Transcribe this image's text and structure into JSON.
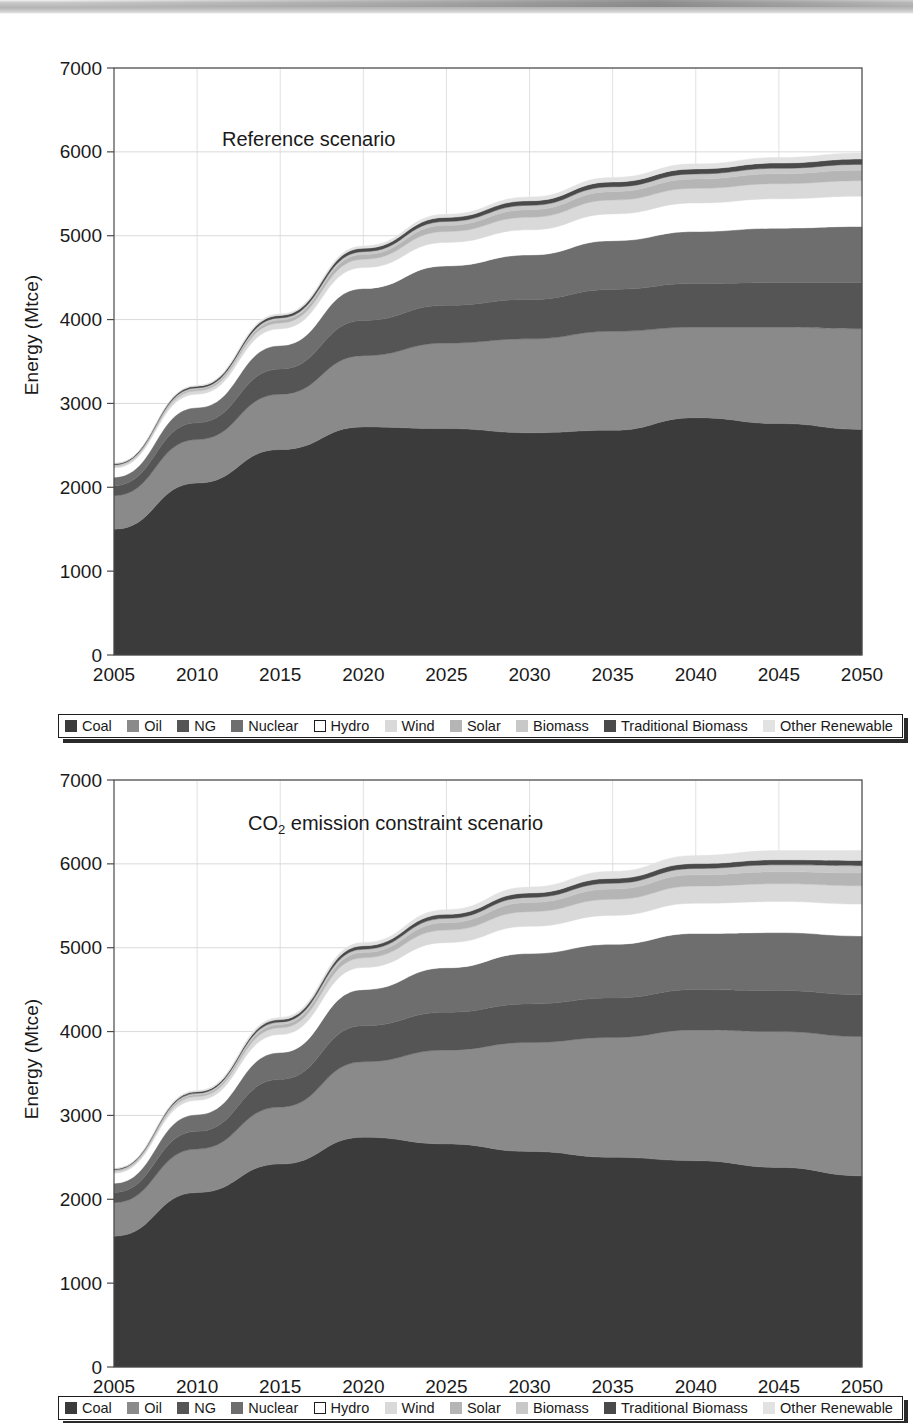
{
  "page": {
    "top_scan_artifact": true,
    "background": "#ffffff"
  },
  "axis": {
    "y_label": "Energy (Mtce)",
    "y_ticks": [
      "0",
      "1000",
      "2000",
      "3000",
      "4000",
      "5000",
      "6000",
      "7000"
    ],
    "x_ticks": [
      "2005",
      "2010",
      "2015",
      "2020",
      "2025",
      "2030",
      "2035",
      "2040",
      "2045",
      "2050"
    ]
  },
  "legend": {
    "items": [
      {
        "label": "Coal",
        "color": "#3b3b3b",
        "style": "solid"
      },
      {
        "label": "Oil",
        "color": "#8a8a8a",
        "style": "solid"
      },
      {
        "label": "NG",
        "color": "#555555",
        "style": "solid"
      },
      {
        "label": "Nuclear",
        "color": "#6e6e6e",
        "style": "solid"
      },
      {
        "label": "Hydro",
        "color": "#ffffff",
        "style": "outline"
      },
      {
        "label": "Wind",
        "color": "#d9d9d9",
        "style": "solid"
      },
      {
        "label": "Solar",
        "color": "#b5b5b5",
        "style": "solid"
      },
      {
        "label": "Biomass",
        "color": "#c8c8c8",
        "style": "solid"
      },
      {
        "label": "Traditional Biomass",
        "color": "#4a4a4a",
        "style": "solid"
      },
      {
        "label": "Other Renewable",
        "color": "#e2e2e2",
        "style": "solid"
      }
    ]
  },
  "chart_data": [
    {
      "id": "reference",
      "type": "area",
      "stacked": true,
      "title": "Reference scenario",
      "xlabel": "",
      "ylabel": "Energy (Mtce)",
      "ylim": [
        0,
        7000
      ],
      "xlim": [
        2005,
        2050
      ],
      "grid": true,
      "legend_position": "bottom",
      "x": [
        2005,
        2010,
        2015,
        2020,
        2025,
        2030,
        2035,
        2040,
        2045,
        2050
      ],
      "series": [
        {
          "name": "Coal",
          "color": "#3b3b3b",
          "values": [
            1500,
            2050,
            2450,
            2720,
            2700,
            2650,
            2680,
            2830,
            2760,
            2690
          ]
        },
        {
          "name": "Oil",
          "color": "#8a8a8a",
          "values": [
            400,
            520,
            660,
            850,
            1020,
            1120,
            1180,
            1080,
            1150,
            1200
          ]
        },
        {
          "name": "NG",
          "color": "#555555",
          "values": [
            120,
            200,
            300,
            420,
            450,
            470,
            500,
            520,
            530,
            550
          ]
        },
        {
          "name": "Nuclear",
          "color": "#6e6e6e",
          "values": [
            100,
            180,
            280,
            380,
            470,
            530,
            580,
            620,
            650,
            670
          ]
        },
        {
          "name": "Hydro",
          "color": "#ffffff",
          "values": [
            110,
            160,
            200,
            250,
            280,
            300,
            320,
            340,
            350,
            360
          ]
        },
        {
          "name": "Wind",
          "color": "#d9d9d9",
          "values": [
            20,
            40,
            70,
            100,
            130,
            150,
            165,
            175,
            180,
            185
          ]
        },
        {
          "name": "Solar",
          "color": "#b5b5b5",
          "values": [
            10,
            20,
            35,
            55,
            75,
            90,
            100,
            110,
            118,
            125
          ]
        },
        {
          "name": "Biomass",
          "color": "#c8c8c8",
          "values": [
            8,
            15,
            25,
            35,
            45,
            52,
            58,
            62,
            66,
            70
          ]
        },
        {
          "name": "Traditional Biomass",
          "color": "#4a4a4a",
          "values": [
            12,
            20,
            30,
            40,
            48,
            54,
            58,
            60,
            62,
            64
          ]
        },
        {
          "name": "Other Renewable",
          "color": "#e2e2e2",
          "values": [
            5,
            10,
            18,
            28,
            38,
            46,
            54,
            60,
            66,
            72
          ]
        }
      ],
      "totals": [
        2285,
        3215,
        4068,
        4878,
        5256,
        5462,
        5695,
        5857,
        5932,
        5986
      ]
    },
    {
      "id": "co2-constraint",
      "type": "area",
      "stacked": true,
      "title": "CO2 emission constraint scenario",
      "title_html": "CO<sub>2</sub> emission constraint scenario",
      "xlabel": "",
      "ylabel": "Energy (Mtce)",
      "ylim": [
        0,
        7000
      ],
      "xlim": [
        2005,
        2050
      ],
      "grid": true,
      "legend_position": "bottom",
      "x": [
        2005,
        2010,
        2015,
        2020,
        2025,
        2030,
        2035,
        2040,
        2045,
        2050
      ],
      "series": [
        {
          "name": "Coal",
          "color": "#3b3b3b",
          "values": [
            1560,
            2080,
            2420,
            2740,
            2660,
            2570,
            2500,
            2460,
            2380,
            2280
          ]
        },
        {
          "name": "Oil",
          "color": "#8a8a8a",
          "values": [
            400,
            520,
            680,
            900,
            1120,
            1300,
            1430,
            1560,
            1620,
            1660
          ]
        },
        {
          "name": "NG",
          "color": "#555555",
          "values": [
            120,
            210,
            330,
            430,
            450,
            460,
            470,
            480,
            490,
            500
          ]
        },
        {
          "name": "Nuclear",
          "color": "#6e6e6e",
          "values": [
            110,
            200,
            320,
            430,
            530,
            600,
            640,
            670,
            690,
            700
          ]
        },
        {
          "name": "Hydro",
          "color": "#ffffff",
          "values": [
            120,
            170,
            215,
            265,
            300,
            325,
            345,
            360,
            370,
            380
          ]
        },
        {
          "name": "Wind",
          "color": "#d9d9d9",
          "values": [
            22,
            45,
            80,
            115,
            150,
            175,
            192,
            205,
            212,
            218
          ]
        },
        {
          "name": "Solar",
          "color": "#b5b5b5",
          "values": [
            10,
            22,
            40,
            62,
            88,
            108,
            122,
            134,
            144,
            152
          ]
        },
        {
          "name": "Biomass",
          "color": "#c8c8c8",
          "values": [
            8,
            16,
            28,
            40,
            52,
            62,
            70,
            76,
            82,
            88
          ]
        },
        {
          "name": "Traditional Biomass",
          "color": "#4a4a4a",
          "values": [
            12,
            20,
            30,
            40,
            48,
            52,
            56,
            58,
            60,
            62
          ]
        },
        {
          "name": "Other Renewable",
          "color": "#e2e2e2",
          "values": [
            6,
            14,
            26,
            40,
            56,
            72,
            86,
            98,
            110,
            120
          ]
        }
      ],
      "totals": [
        2368,
        3297,
        4169,
        5062,
        5454,
        5724,
        5911,
        6101,
        6158,
        6160
      ]
    }
  ]
}
